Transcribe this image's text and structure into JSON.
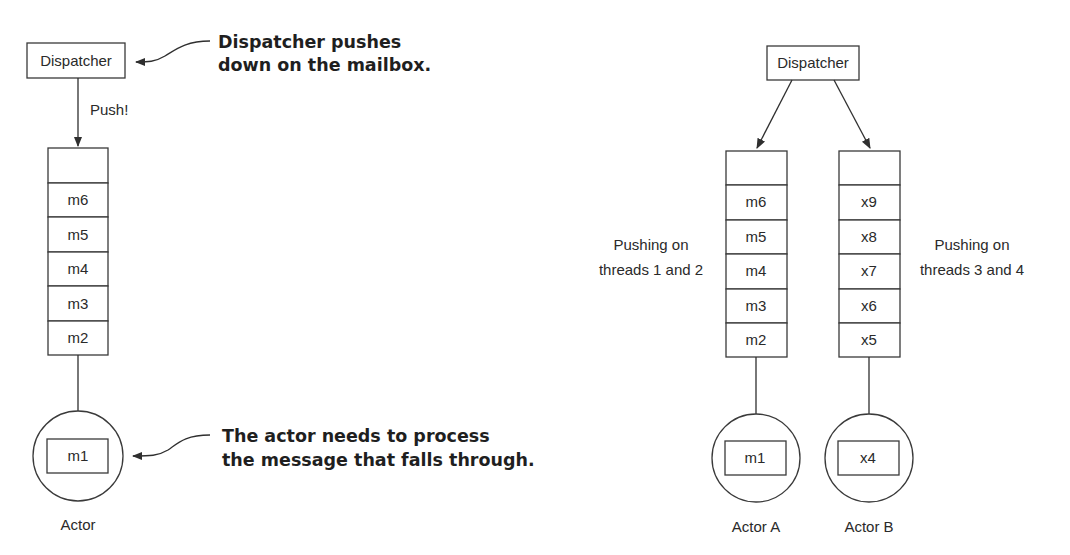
{
  "left_diagram": {
    "dispatcher_label": "Dispatcher",
    "push_label": "Push!",
    "mailbox": [
      "",
      "m6",
      "m5",
      "m4",
      "m3",
      "m2"
    ],
    "actor_message": "m1",
    "actor_label": "Actor",
    "annotation_top": [
      "Dispatcher pushes",
      "down on the mailbox."
    ],
    "annotation_bottom": [
      "The actor needs to process",
      "the message that falls through."
    ]
  },
  "right_diagram": {
    "dispatcher_label": "Dispatcher",
    "mailbox_a": [
      "",
      "m6",
      "m5",
      "m4",
      "m3",
      "m2"
    ],
    "mailbox_b": [
      "",
      "x9",
      "x8",
      "x7",
      "x6",
      "x5"
    ],
    "threads_a_label": [
      "Pushing on",
      "threads 1 and 2"
    ],
    "threads_b_label": [
      "Pushing on",
      "threads 3 and 4"
    ],
    "actor_a_message": "m1",
    "actor_b_message": "x4",
    "actor_a_label": "Actor A",
    "actor_b_label": "Actor B"
  }
}
